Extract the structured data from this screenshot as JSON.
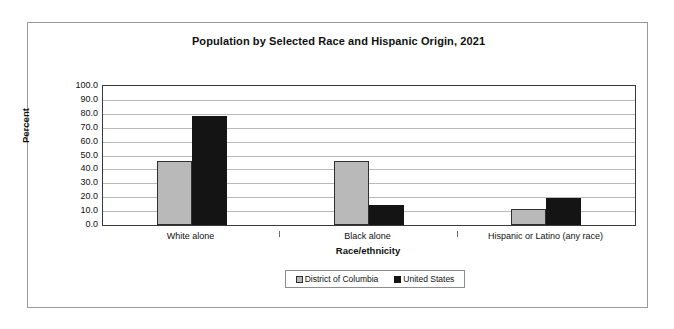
{
  "chart_data": {
    "type": "bar",
    "title": "Population by Selected Race and Hispanic Origin, 2021",
    "xlabel": "Race/ethnicity",
    "ylabel": "Percent",
    "ylim": [
      0,
      100
    ],
    "ytick_step": 10,
    "ytick_labels": [
      "100.0",
      "90.0",
      "80.0",
      "70.0",
      "60.0",
      "50.0",
      "40.0",
      "30.0",
      "20.0",
      "10.0",
      "0.0"
    ],
    "grid": true,
    "legend_position": "bottom-center",
    "categories": [
      "White alone",
      "Black alone",
      "Hispanic or Latino (any race)"
    ],
    "series": [
      {
        "name": "District of Columbia",
        "color": "#b9b9b9",
        "values": [
          45.8,
          45.8,
          11.5
        ]
      },
      {
        "name": "United States",
        "color": "#141414",
        "values": [
          78.5,
          14.5,
          19.5
        ]
      }
    ]
  },
  "frame": {
    "border_color": "#9a9a9a"
  }
}
